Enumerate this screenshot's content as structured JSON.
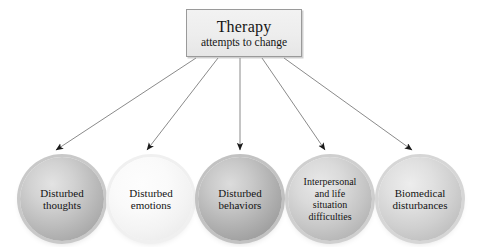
{
  "diagram": {
    "source_box": {
      "title": "Therapy",
      "subtitle": "attempts to change"
    },
    "nodes": [
      {
        "id": "disturbed-thoughts",
        "label": "Disturbed\nthoughts",
        "fill": "#bcbcbc"
      },
      {
        "id": "disturbed-emotions",
        "label": "Disturbed\nemotions",
        "fill": "#f3f3f3"
      },
      {
        "id": "disturbed-behaviors",
        "label": "Disturbed\nbehaviors",
        "fill": "#b2b2b2"
      },
      {
        "id": "interpersonal-life",
        "label": "Interpersonal\nand life\nsituation\ndifficulties",
        "fill": "#c6c6c6"
      },
      {
        "id": "biomedical",
        "label": "Biomedical\ndisturbances",
        "fill": "#cfcfcf"
      }
    ],
    "arrows": {
      "count": 5,
      "line_color": "#7d7d7d",
      "head_color": "#1a1a1a"
    },
    "colors": {
      "background": "#ffffff",
      "box_border": "#9a9a9a",
      "box_fill": "#ededed",
      "text": "#141414"
    }
  }
}
